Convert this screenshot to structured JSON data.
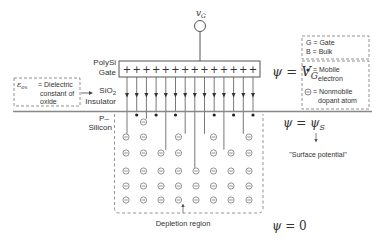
{
  "colors": {
    "line": "#555555",
    "text": "#333333",
    "dash": "#777777",
    "background": "#ffffff"
  },
  "gate_voltage": {
    "symbol": "v",
    "subscript": "G"
  },
  "labels": {
    "polysi": "PolySi",
    "gate": "Gate",
    "sio2_main": "SiO",
    "sio2_sub": "2",
    "insulator": "Insulator",
    "p_minus": "P–",
    "silicon": "Silicon",
    "depletion_region": "Depletion region",
    "surface_potential": "\"Surface potential\""
  },
  "equations": {
    "psi_vg": {
      "lhs": "ψ",
      "eq": " = ",
      "rhs": "V",
      "sub": "G"
    },
    "psi_s": {
      "lhs": "ψ",
      "eq": " = ",
      "rhs": "ψ",
      "sub": "S"
    },
    "psi_0": {
      "lhs": "ψ",
      "eq": " = ",
      "rhs": "0"
    }
  },
  "oxide_note": {
    "symbol": "ε",
    "sub": "ox",
    "line1": "= Dielectric",
    "line2": "constant of",
    "line3": "oxide"
  },
  "legend": {
    "terminals": [
      "G = Gate",
      "B = Bulk"
    ],
    "symbols": [
      {
        "icon": "filled-dot",
        "line1": "= Mobile",
        "line2": "electron"
      },
      {
        "icon": "circled-minus",
        "line1": "= Nonmobile",
        "line2": "dopant atom"
      }
    ]
  },
  "gate_charges": {
    "symbol": "+",
    "count": 14
  },
  "field_lines": {
    "count": 14
  },
  "dopant_grid": {
    "columns": 8,
    "rows": 5,
    "symbol": "⊖"
  }
}
